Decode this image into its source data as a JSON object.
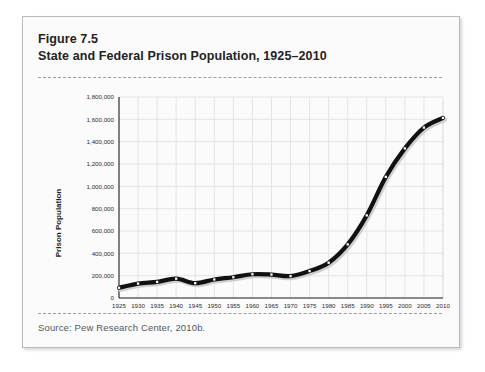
{
  "figure": {
    "number_label": "Figure 7.5",
    "title": "State and Federal Prison Population, 1925–2010",
    "source": "Source: Pew Research Center, 2010b."
  },
  "colors": {
    "card_background": "#fbfbfb",
    "card_border": "#b9b9b9",
    "title_text": "#232323",
    "source_text": "#55585c",
    "dashed_rule": "#9c9c9c",
    "line_series": "#111111",
    "marker_fill": "#ffffff",
    "gridline": "#e2e4e6",
    "axis": "#1a1a1a",
    "shadow": "#cfcfcf"
  },
  "chart_data": {
    "type": "line",
    "title": "State and Federal Prison Population, 1925–2010",
    "xlabel": "",
    "ylabel": "Prison Population",
    "xlim": [
      1925,
      2010
    ],
    "ylim": [
      0,
      1800000
    ],
    "grid": true,
    "legend": "none",
    "markers": "white square",
    "ytick_labels": [
      "0",
      "200,000",
      "400,000",
      "600,000",
      "800,000",
      "1,000,000",
      "1,200,000",
      "1,400,000",
      "1,600,000",
      "1,800,000"
    ],
    "ytick_values": [
      0,
      200000,
      400000,
      600000,
      800000,
      1000000,
      1200000,
      1400000,
      1600000,
      1800000
    ],
    "xtick_labels": [
      "1925",
      "1930",
      "1935",
      "1940",
      "1945",
      "1950",
      "1955",
      "1960",
      "1965",
      "1970",
      "1975",
      "1980",
      "1985",
      "1990",
      "1995",
      "2000",
      "2005",
      "2010"
    ],
    "x": [
      1925,
      1930,
      1935,
      1940,
      1945,
      1950,
      1955,
      1960,
      1965,
      1970,
      1975,
      1980,
      1985,
      1990,
      1995,
      2000,
      2005,
      2010
    ],
    "values": [
      92000,
      129000,
      144000,
      173000,
      133000,
      166000,
      186000,
      213000,
      210000,
      196000,
      241000,
      316000,
      480000,
      740000,
      1085000,
      1340000,
      1526000,
      1613000
    ],
    "series": [
      {
        "name": "State and Federal Prison Population",
        "values": [
          92000,
          129000,
          144000,
          173000,
          133000,
          166000,
          186000,
          213000,
          210000,
          196000,
          241000,
          316000,
          480000,
          740000,
          1085000,
          1340000,
          1526000,
          1613000
        ]
      }
    ]
  }
}
